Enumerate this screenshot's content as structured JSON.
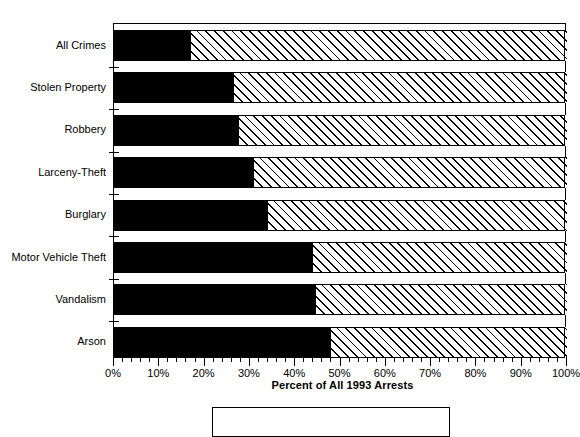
{
  "chart_data": {
    "type": "bar",
    "orientation": "horizontal",
    "stacked": true,
    "title": "",
    "xlabel": "Percent of All 1993 Arrests",
    "ylabel": "",
    "xlim": [
      0,
      100
    ],
    "xticks": [
      "0%",
      "10%",
      "20%",
      "30%",
      "40%",
      "50%",
      "60%",
      "70%",
      "80%",
      "90%",
      "100%"
    ],
    "xtick_values": [
      0,
      10,
      20,
      30,
      40,
      50,
      60,
      70,
      80,
      90,
      100
    ],
    "minor_ticks_per_interval": 5,
    "grid": false,
    "legend_position": "below-axis",
    "categories": [
      "All Crimes",
      "Stolen Property",
      "Robbery",
      "Larceny-Theft",
      "Burglary",
      "Motor Vehicle Theft",
      "Vandalism",
      "Arson"
    ],
    "series": [
      {
        "name": "juveniles-segment",
        "fill": "solid-black",
        "color": "#000000",
        "values": [
          17,
          26.5,
          27.5,
          31,
          34,
          44,
          44.5,
          48
        ]
      },
      {
        "name": "adults-segment",
        "fill": "diagonal-hatch",
        "color": "#ffffff",
        "values": [
          83,
          73.5,
          72.5,
          69,
          66,
          56,
          55.5,
          52
        ]
      }
    ]
  },
  "axis": {
    "x_title": "Percent of All 1993 Arrests"
  },
  "legend": {
    "items": []
  }
}
